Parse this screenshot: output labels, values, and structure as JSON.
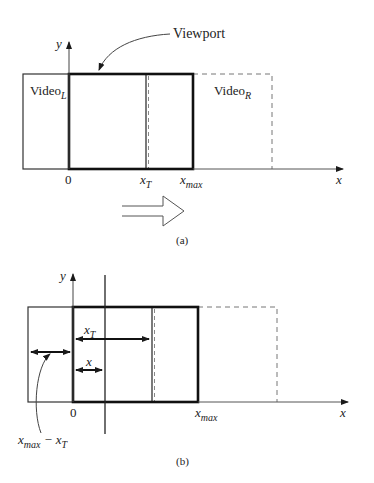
{
  "figure_a": {
    "caption": "(a)",
    "axis_y_label": "y",
    "axis_x_label": "x",
    "callout": "Viewport",
    "video_left": {
      "base": "Video",
      "sub": "L"
    },
    "video_right": {
      "base": "Video",
      "sub": "R"
    },
    "tick_zero": "0",
    "tick_xt": {
      "base": "x",
      "sub": "T"
    },
    "tick_xmax": {
      "base": "x",
      "sub": "max"
    },
    "motion_arrow": "hollow-right-arrow"
  },
  "figure_b": {
    "caption": "(b)",
    "axis_y_label": "y",
    "axis_x_label": "x",
    "tick_zero": "0",
    "tick_xmax": {
      "base": "x",
      "sub": "max"
    },
    "dim_xt": {
      "base": "x",
      "sub": "T"
    },
    "dim_x": "x",
    "dim_diff": {
      "a": "x",
      "a_sub": "max",
      "op": " − ",
      "b": "x",
      "b_sub": "T"
    }
  },
  "colors": {
    "line": "#1a1a1a",
    "thin": "#444444",
    "dashed": "#777777",
    "background": "#ffffff"
  }
}
